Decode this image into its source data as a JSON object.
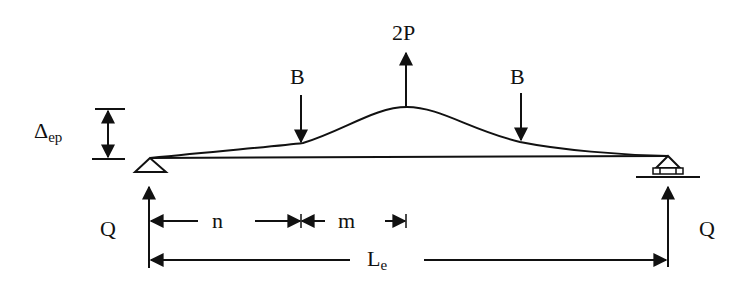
{
  "diagram": {
    "colors": {
      "stroke": "#111111",
      "background": "#ffffff"
    },
    "labels": {
      "center_load": "2P",
      "left_load": "B",
      "right_load": "B",
      "deflection_main": "Δ",
      "deflection_sub": "ep",
      "left_reaction": "Q",
      "right_reaction": "Q",
      "dim_n": "n",
      "dim_m": "m",
      "span_main": "L",
      "span_sub": "e"
    },
    "elements": {
      "left_support": "pin-support (triangle)",
      "right_support": "roller-support",
      "beam": "straight beam with deflected curve peaking at center"
    }
  }
}
